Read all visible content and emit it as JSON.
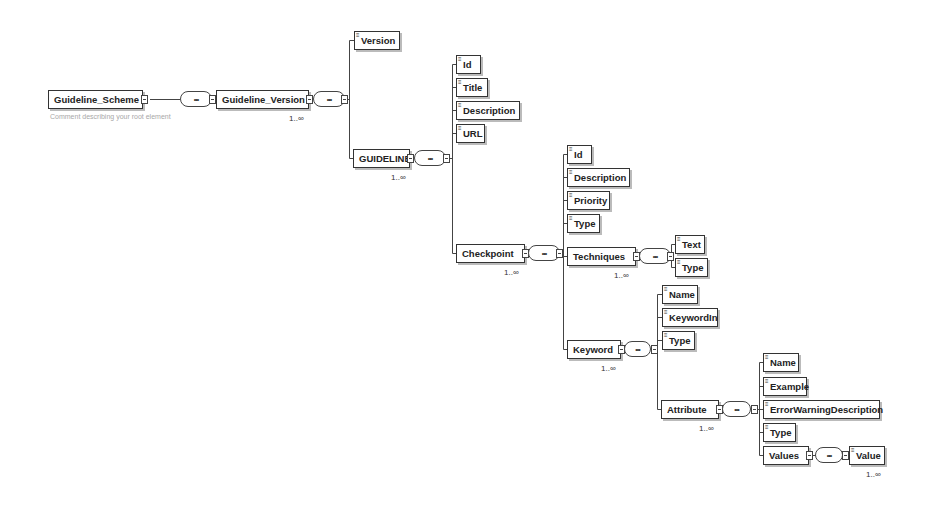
{
  "diagram": {
    "root": {
      "label": "Guideline_Scheme",
      "comment": "Comment describing your root element"
    },
    "sequence_symbol": "•••",
    "guideline_version": {
      "label": "Guideline_Version",
      "cardinality": "1..∞"
    },
    "version": {
      "label": "Version"
    },
    "guideline": {
      "label": "GUIDELINE",
      "cardinality": "1..∞"
    },
    "guideline_children": [
      {
        "label": "Id"
      },
      {
        "label": "Title"
      },
      {
        "label": "Description"
      },
      {
        "label": "URL"
      }
    ],
    "checkpoint": {
      "label": "Checkpoint",
      "cardinality": "1..∞"
    },
    "checkpoint_children": [
      {
        "label": "Id"
      },
      {
        "label": "Description"
      },
      {
        "label": "Priority"
      },
      {
        "label": "Type"
      }
    ],
    "techniques": {
      "label": "Techniques",
      "cardinality": "1..∞"
    },
    "techniques_children": [
      {
        "label": "Text"
      },
      {
        "label": "Type"
      }
    ],
    "keyword": {
      "label": "Keyword",
      "cardinality": "1..∞"
    },
    "keyword_children": [
      {
        "label": "Name"
      },
      {
        "label": "KeywordIn"
      },
      {
        "label": "Type"
      }
    ],
    "attribute": {
      "label": "Attribute",
      "cardinality": "1..∞"
    },
    "attribute_children": [
      {
        "label": "Name"
      },
      {
        "label": "Example"
      },
      {
        "label": "ErrorWarningDescription"
      },
      {
        "label": "Type"
      }
    ],
    "values": {
      "label": "Values"
    },
    "value": {
      "label": "Value",
      "cardinality": "1..∞"
    }
  }
}
